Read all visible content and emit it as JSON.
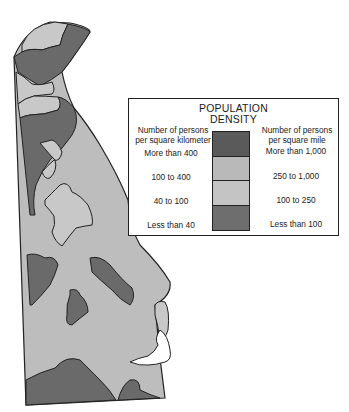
{
  "legend": {
    "title_line1": "POPULATION",
    "title_line2": "DENSITY",
    "left_header_line1": "Number of persons",
    "left_header_line2": "per square kilometer",
    "right_header_line1": "Number of persons",
    "right_header_line2": "per square mile",
    "rows": [
      {
        "km": "More than 400",
        "mile": "More than 1,000",
        "color": "#5a5a5a"
      },
      {
        "km": "100 to 400",
        "mile": "250 to 1,000",
        "color": "#b9b9b9"
      },
      {
        "km": "40 to 100",
        "mile": "100 to 250",
        "color": "#c4c4c4"
      },
      {
        "km": "Less than 40",
        "mile": "Less than 100",
        "color": "#6e6e6e"
      }
    ]
  },
  "map": {
    "region": "Delaware",
    "colors": {
      "dark": "#6a6a6a",
      "light": "#bdbdbd",
      "lighter": "#c8c8c8",
      "water": "#ffffff",
      "border": "#222222"
    }
  }
}
